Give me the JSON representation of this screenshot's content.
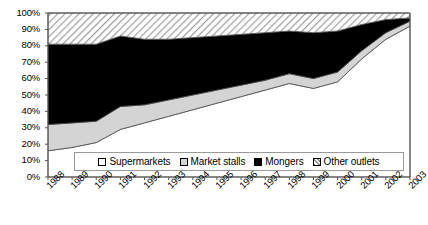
{
  "chart_data": {
    "type": "area",
    "stacked": "percent",
    "title": "",
    "subtitle": "",
    "xlabel": "",
    "ylabel": "",
    "ylim": [
      0,
      100
    ],
    "grid": false,
    "legend_position": "inside-bottom-center",
    "categories": [
      "1988",
      "1989",
      "1990",
      "1991",
      "1992",
      "1993",
      "1994",
      "1995",
      "1996",
      "1997",
      "1998",
      "1999",
      "2000",
      "2001",
      "2002",
      "2003"
    ],
    "ytick_labels": [
      "0%",
      "10%",
      "20%",
      "30%",
      "40%",
      "50%",
      "60%",
      "70%",
      "80%",
      "90%",
      "100%"
    ],
    "ytick_values": [
      0,
      10,
      20,
      30,
      40,
      50,
      60,
      70,
      80,
      90,
      100
    ],
    "series": [
      {
        "name": "Supermarkets",
        "color": "#ffffff",
        "pattern": "solid",
        "values": [
          16,
          18,
          21,
          29,
          33,
          37,
          41,
          45,
          49,
          53,
          57,
          54,
          58,
          72,
          84,
          92
        ]
      },
      {
        "name": "Market stalls",
        "color": "#d4d4d4",
        "pattern": "solid",
        "values": [
          16,
          15,
          13,
          14,
          11,
          10,
          9,
          8,
          7,
          6,
          6,
          6,
          6,
          5,
          4,
          3
        ]
      },
      {
        "name": "Mongers",
        "color": "#000000",
        "pattern": "solid",
        "values": [
          49,
          48,
          47,
          43,
          40,
          37,
          35,
          33,
          31,
          29,
          26,
          28,
          25,
          16,
          8,
          2
        ]
      },
      {
        "name": "Other outlets",
        "color": "#cccccc",
        "pattern": "diagonal-hatch",
        "values": [
          19,
          19,
          19,
          14,
          16,
          16,
          15,
          14,
          13,
          12,
          11,
          12,
          11,
          7,
          4,
          3
        ]
      }
    ],
    "cumulative_tops": {
      "supermarkets": [
        16,
        18,
        21,
        29,
        33,
        37,
        41,
        45,
        49,
        53,
        57,
        54,
        58,
        72,
        84,
        92
      ],
      "market_stalls": [
        32,
        33,
        34,
        43,
        44,
        47,
        50,
        53,
        56,
        59,
        63,
        60,
        64,
        77,
        88,
        95
      ],
      "mongers": [
        81,
        81,
        81,
        86,
        84,
        84,
        85,
        86,
        87,
        88,
        89,
        88,
        89,
        93,
        96,
        97
      ],
      "other_outlets": [
        100,
        100,
        100,
        100,
        100,
        100,
        100,
        100,
        100,
        100,
        100,
        100,
        100,
        100,
        100,
        100
      ]
    }
  },
  "legend": {
    "items": [
      {
        "label": "Supermarkets"
      },
      {
        "label": "Market stalls"
      },
      {
        "label": "Mongers"
      },
      {
        "label": "Other outlets"
      }
    ]
  }
}
